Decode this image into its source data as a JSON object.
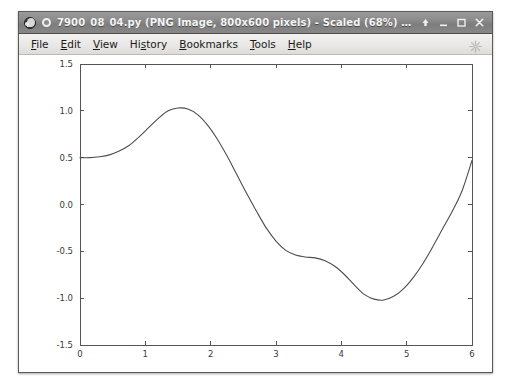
{
  "window": {
    "title": "7900_08_04.py (PNG Image, 800x600 pixels) - Scaled (68%) - Iceweasel",
    "app_icon_name": "iceweasel-icon",
    "favicon_name": "page-favicon-icon",
    "buttons": [
      {
        "name": "shade-button",
        "glyph": "shade"
      },
      {
        "name": "minimize-button",
        "glyph": "minimize"
      },
      {
        "name": "maximize-button",
        "glyph": "maximize"
      },
      {
        "name": "close-button",
        "glyph": "close"
      }
    ]
  },
  "menubar": {
    "items": [
      {
        "label": "File",
        "accel": "F"
      },
      {
        "label": "Edit",
        "accel": "E"
      },
      {
        "label": "View",
        "accel": "V"
      },
      {
        "label": "History",
        "accel": "s"
      },
      {
        "label": "Bookmarks",
        "accel": "B"
      },
      {
        "label": "Tools",
        "accel": "T"
      },
      {
        "label": "Help",
        "accel": "H"
      }
    ],
    "throbber_name": "throbber-icon"
  },
  "colors": {
    "titlebar": "#8c8c8c",
    "titlebar_text": "#f5f5f5",
    "menubar": "#e9e8e6",
    "window_border": "#5a5a5a",
    "curve": "#4d4d4d",
    "axis": "#555555",
    "plot_background": "#ffffff"
  },
  "chart_data": {
    "type": "line",
    "title": "",
    "xlabel": "",
    "ylabel": "",
    "xlim": [
      0,
      6
    ],
    "ylim": [
      -1.5,
      1.5
    ],
    "xticks": [
      0,
      1,
      2,
      3,
      4,
      5,
      6
    ],
    "yticks": [
      -1.5,
      -1.0,
      -0.5,
      0.0,
      0.5,
      1.0,
      1.5
    ],
    "xticklabels": [
      "0",
      "1",
      "2",
      "3",
      "4",
      "5",
      "6"
    ],
    "yticklabels": [
      "-1.5",
      "-1.0",
      "-0.5",
      "0.0",
      "0.5",
      "1.0",
      "1.5"
    ],
    "grid": false,
    "legend": null,
    "series": [
      {
        "name": "curve",
        "color": "#4d4d4d",
        "linewidth": 1.1,
        "x": [
          0.0,
          0.15,
          0.3,
          0.45,
          0.6,
          0.75,
          0.9,
          1.05,
          1.2,
          1.35,
          1.5,
          1.65,
          1.8,
          1.95,
          2.1,
          2.25,
          2.4,
          2.55,
          2.7,
          2.85,
          3.0,
          3.15,
          3.3,
          3.45,
          3.6,
          3.75,
          3.9,
          4.05,
          4.2,
          4.35,
          4.5,
          4.65,
          4.8,
          4.95,
          5.1,
          5.25,
          5.4,
          5.55,
          5.7,
          5.85,
          6.0
        ],
        "y": [
          0.5,
          0.5,
          0.51,
          0.53,
          0.57,
          0.63,
          0.72,
          0.82,
          0.92,
          1.0,
          1.03,
          1.02,
          0.96,
          0.85,
          0.7,
          0.52,
          0.32,
          0.12,
          -0.07,
          -0.25,
          -0.39,
          -0.49,
          -0.54,
          -0.56,
          -0.57,
          -0.6,
          -0.66,
          -0.75,
          -0.86,
          -0.96,
          -1.01,
          -1.02,
          -0.98,
          -0.9,
          -0.78,
          -0.63,
          -0.45,
          -0.26,
          -0.07,
          0.15,
          0.47
        ]
      }
    ]
  }
}
